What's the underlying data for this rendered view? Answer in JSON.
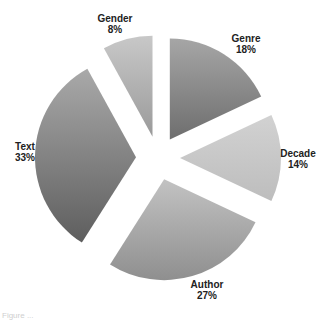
{
  "chart_data": {
    "type": "pie",
    "title": "",
    "exploded": true,
    "start_angle_deg": 0,
    "direction": "clockwise",
    "categories": [
      "Genre",
      "Decade",
      "Author",
      "Text",
      "Gender"
    ],
    "values": [
      18,
      14,
      27,
      33,
      8
    ],
    "unit": "%",
    "labels": [
      {
        "name": "Genre",
        "percent": "18%"
      },
      {
        "name": "Decade",
        "percent": "14%"
      },
      {
        "name": "Author",
        "percent": "27%"
      },
      {
        "name": "Text",
        "percent": "33%"
      },
      {
        "name": "Gender",
        "percent": "8%"
      }
    ],
    "legend": "none (data labels outside slices)",
    "colors": {
      "Genre": [
        "#a6a6a6",
        "#6e6e6e"
      ],
      "Decade": [
        "#d2d2d2",
        "#bdbdbd"
      ],
      "Author": [
        "#c2c2c2",
        "#8f8f8f"
      ],
      "Text": [
        "#a9a9a9",
        "#5e5e5e"
      ],
      "Gender": [
        "#c8c8c8",
        "#9a9a9a"
      ]
    }
  },
  "geometry": {
    "cx": 158,
    "cy": 158,
    "r": 101,
    "explode_px": 22
  },
  "slices": [
    {
      "key": "genre",
      "name": "Genre",
      "percent": "18%",
      "label_x": 246,
      "label_y": 44
    },
    {
      "key": "decade",
      "name": "Decade",
      "percent": "14%",
      "label_x": 298,
      "label_y": 159
    },
    {
      "key": "author",
      "name": "Author",
      "percent": "27%",
      "label_x": 207,
      "label_y": 290
    },
    {
      "key": "text",
      "name": "Text",
      "percent": "33%",
      "label_x": 25,
      "label_y": 152
    },
    {
      "key": "gender",
      "name": "Gender",
      "percent": "8%",
      "label_x": 115,
      "label_y": 24
    }
  ],
  "caption": "Figure ..."
}
